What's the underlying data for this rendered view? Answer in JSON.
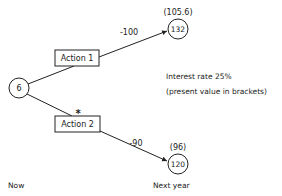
{
  "diagram": {
    "type": "decision-tree",
    "root": {
      "value": "6"
    },
    "actions": [
      {
        "label": "Action 1",
        "marked": false,
        "cost": "-100",
        "outcome": "132",
        "present_value": "(105.6)"
      },
      {
        "label": "Action 2",
        "marked": true,
        "marker": "*",
        "cost": "-90",
        "outcome": "120",
        "present_value": "(96)"
      }
    ],
    "note": {
      "line1": "Interest rate 25%",
      "line2": "(present value in brackets)"
    },
    "time_axis": {
      "start": "Now",
      "end": "Next year"
    }
  }
}
